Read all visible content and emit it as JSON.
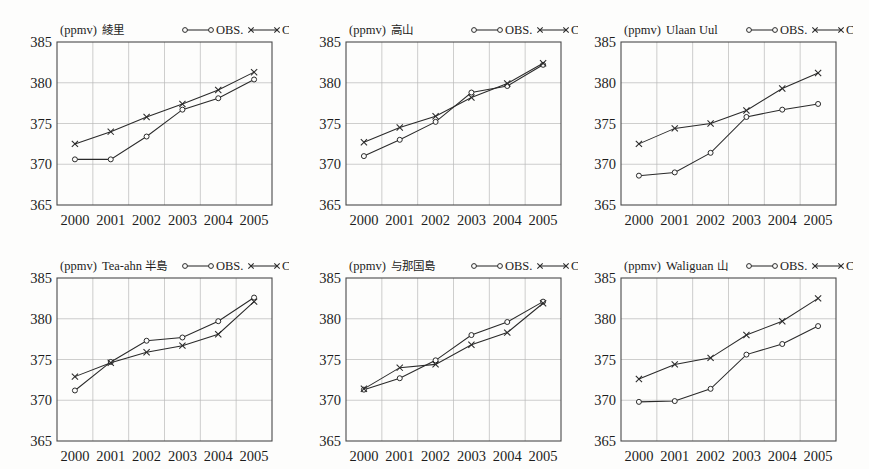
{
  "figure": {
    "units_label": "(ppmv)",
    "legend": {
      "obs": "OBS.",
      "cal": "CAL."
    },
    "y_ticks": [
      "385",
      "380",
      "375",
      "370",
      "365"
    ],
    "x_ticks": [
      "2000",
      "2001",
      "2002",
      "2003",
      "2004",
      "2005"
    ],
    "marker_obs": "open-circle",
    "marker_cal": "cross-x",
    "line_color": "#2a2a2a",
    "grid_color": "#b9b9b9"
  },
  "chart_data": [
    {
      "type": "line",
      "title": "綾里",
      "xlabel": "",
      "ylabel": "(ppmv)",
      "x": [
        2000,
        2001,
        2002,
        2003,
        2004,
        2005
      ],
      "ylim": [
        365,
        385
      ],
      "xlim": [
        1999.5,
        2005.5
      ],
      "grid": true,
      "legend_position": "top-right",
      "series": [
        {
          "name": "OBS.",
          "values": [
            370.6,
            370.6,
            373.4,
            376.7,
            378.1,
            380.4
          ]
        },
        {
          "name": "CAL.",
          "values": [
            372.5,
            374.0,
            375.8,
            377.4,
            379.1,
            381.3
          ]
        }
      ]
    },
    {
      "type": "line",
      "title": "高山",
      "xlabel": "",
      "ylabel": "(ppmv)",
      "x": [
        2000,
        2001,
        2002,
        2003,
        2004,
        2005
      ],
      "ylim": [
        365,
        385
      ],
      "xlim": [
        1999.5,
        2005.5
      ],
      "grid": true,
      "legend_position": "top-right",
      "series": [
        {
          "name": "OBS.",
          "values": [
            371.0,
            373.0,
            375.2,
            378.8,
            379.6,
            382.2
          ]
        },
        {
          "name": "CAL.",
          "values": [
            372.7,
            374.5,
            375.9,
            378.2,
            379.9,
            382.4
          ]
        }
      ]
    },
    {
      "type": "line",
      "title": "Ulaan Uul",
      "xlabel": "",
      "ylabel": "(ppmv)",
      "x": [
        2000,
        2001,
        2002,
        2003,
        2004,
        2005
      ],
      "ylim": [
        365,
        385
      ],
      "xlim": [
        1999.5,
        2005.5
      ],
      "grid": true,
      "legend_position": "top-right",
      "series": [
        {
          "name": "OBS.",
          "values": [
            368.6,
            369.0,
            371.4,
            375.8,
            376.7,
            377.4
          ]
        },
        {
          "name": "CAL.",
          "values": [
            372.5,
            374.4,
            375.0,
            376.6,
            379.3,
            381.2
          ]
        }
      ]
    },
    {
      "type": "line",
      "title": "Tea-ahn 半島",
      "xlabel": "",
      "ylabel": "(ppmv)",
      "x": [
        2000,
        2001,
        2002,
        2003,
        2004,
        2005
      ],
      "ylim": [
        365,
        385
      ],
      "xlim": [
        1999.5,
        2005.5
      ],
      "grid": true,
      "legend_position": "top-right",
      "series": [
        {
          "name": "OBS.",
          "values": [
            371.2,
            374.7,
            377.3,
            377.7,
            379.7,
            382.6
          ]
        },
        {
          "name": "CAL.",
          "values": [
            372.9,
            374.6,
            375.9,
            376.7,
            378.1,
            382.1
          ]
        }
      ]
    },
    {
      "type": "line",
      "title": "与那国島",
      "xlabel": "",
      "ylabel": "(ppmv)",
      "x": [
        2000,
        2001,
        2002,
        2003,
        2004,
        2005
      ],
      "ylim": [
        365,
        385
      ],
      "xlim": [
        1999.5,
        2005.5
      ],
      "grid": true,
      "legend_position": "top-right",
      "series": [
        {
          "name": "OBS.",
          "values": [
            371.3,
            372.7,
            374.9,
            378.0,
            379.6,
            382.1
          ]
        },
        {
          "name": "CAL.",
          "values": [
            371.4,
            374.0,
            374.4,
            376.8,
            378.3,
            381.9
          ]
        }
      ]
    },
    {
      "type": "line",
      "title": "Waliguan 山",
      "xlabel": "",
      "ylabel": "(ppmv)",
      "x": [
        2000,
        2001,
        2002,
        2003,
        2004,
        2005
      ],
      "ylim": [
        365,
        385
      ],
      "xlim": [
        1999.5,
        2005.5
      ],
      "grid": true,
      "legend_position": "top-right",
      "series": [
        {
          "name": "OBS.",
          "values": [
            369.8,
            369.9,
            371.4,
            375.6,
            376.9,
            379.1
          ]
        },
        {
          "name": "CAL.",
          "values": [
            372.6,
            374.4,
            375.2,
            378.0,
            379.7,
            382.5
          ]
        }
      ]
    }
  ]
}
